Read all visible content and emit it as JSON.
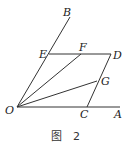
{
  "figure": {
    "caption": "图 2",
    "caption_parts": [
      "图",
      "2"
    ],
    "points": {
      "O": {
        "label": "O",
        "x": 17,
        "y": 107
      },
      "A": {
        "label": "A",
        "x": 120,
        "y": 107
      },
      "B": {
        "label": "B",
        "x": 70,
        "y": 17
      },
      "C": {
        "label": "C",
        "x": 87,
        "y": 107
      },
      "D": {
        "label": "D",
        "x": 111,
        "y": 54
      },
      "E": {
        "label": "E",
        "x": 49,
        "y": 54
      },
      "F": {
        "label": "F",
        "x": 81,
        "y": 54
      },
      "G": {
        "label": "G",
        "x": 97,
        "y": 81
      }
    },
    "segments": [
      "OA",
      "OB",
      "ED",
      "DC",
      "OF",
      "OG"
    ]
  }
}
